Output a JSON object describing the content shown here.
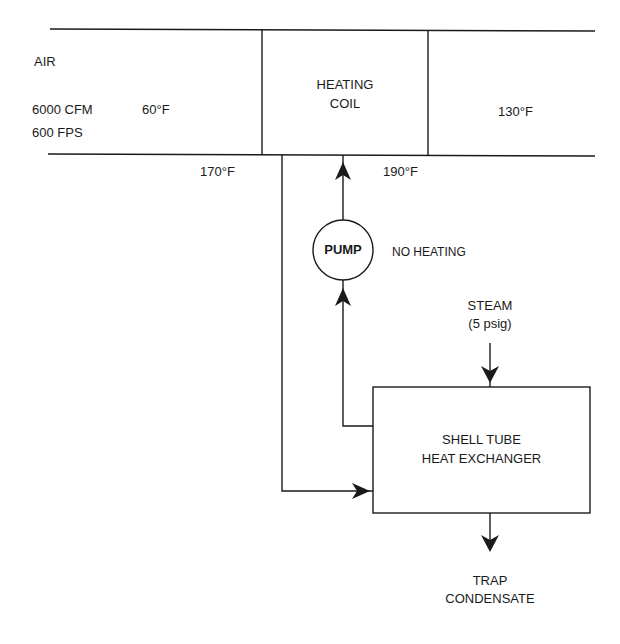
{
  "duct": {
    "air_label": "AIR",
    "inlet_flow": "6000 CFM",
    "inlet_velocity": "600 FPS",
    "inlet_temp": "60°F",
    "outlet_temp": "130°F"
  },
  "heating_coil": {
    "label_line1": "HEATING",
    "label_line2": "COIL",
    "return_temp": "170°F",
    "supply_temp": "190°F"
  },
  "pump": {
    "label": "PUMP",
    "note": "NO HEATING"
  },
  "steam": {
    "label_line1": "STEAM",
    "label_line2": "(5 psig)"
  },
  "heat_exchanger": {
    "label_line1": "SHELL TUBE",
    "label_line2": "HEAT EXCHANGER"
  },
  "condensate": {
    "label_line1": "TRAP",
    "label_line2": "CONDENSATE"
  },
  "colors": {
    "line": "#1a1a1a",
    "background": "#ffffff"
  }
}
